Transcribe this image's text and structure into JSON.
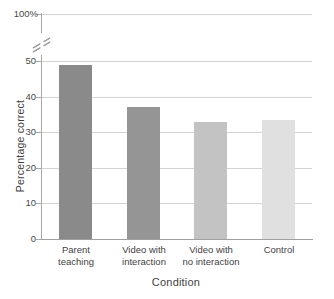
{
  "chart_data": {
    "type": "bar",
    "title": "",
    "xlabel": "Condition",
    "ylabel": "Percentage correct",
    "categories": [
      "Parent teaching",
      "Video with interaction",
      "Video with no interaction",
      "Control"
    ],
    "category_lines": [
      [
        "Parent",
        "teaching"
      ],
      [
        "Video with",
        "interaction"
      ],
      [
        "Video with",
        "no interaction"
      ],
      [
        "Control",
        ""
      ]
    ],
    "values": [
      49,
      37,
      33,
      33.5
    ],
    "bar_colors": [
      "#8a8a8a",
      "#959595",
      "#c3c3c3",
      "#e0e0e0"
    ],
    "ylim": [
      0,
      50
    ],
    "yticks": [
      0,
      10,
      20,
      30,
      40,
      50
    ],
    "ytick_labels": [
      "0",
      "10",
      "20",
      "30",
      "40",
      "50"
    ],
    "axis_break": true,
    "axis_break_between": [
      50,
      100
    ],
    "top_tick_value": 100,
    "top_tick_label": "100%",
    "grid": true,
    "grid_color": "#d3d3d3",
    "axis_color": "#a8a8a8",
    "legend": "none"
  },
  "axis": {
    "y_title": "Percentage correct",
    "x_title": "Condition"
  }
}
